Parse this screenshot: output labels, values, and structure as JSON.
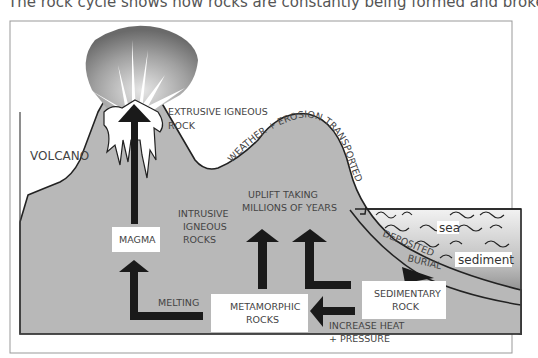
{
  "caption": "The rock cycle shows how rocks are constantly being formed and broken down.",
  "diagram": {
    "labels": {
      "volcano": "VOLCANO",
      "extrusive_line1": "EXTRUSIVE  IGNEOUS",
      "extrusive_line2": "ROCK",
      "weather": "WEATHER + EROSION TRANSPORTED",
      "uplift_line1": "UPLIFT TAKING",
      "uplift_line2": "MILLIONS OF YEARS",
      "intrusive_line1": "INTRUSIVE",
      "intrusive_line2": "IGNEOUS",
      "intrusive_line3": "ROCKS",
      "melting": "MELTING",
      "heat_line1": "INCREASE HEAT",
      "heat_line2": "+ PRESSURE",
      "deposited": "DEPOSITED",
      "burial": "BURIAL",
      "sea": "sea",
      "sediment": "sediment"
    },
    "boxes": {
      "magma": "MAGMA",
      "metamorphic_line1": "METAMORPHIC",
      "metamorphic_line2": "ROCKS",
      "sedimentary_line1": "SEDIMENTARY",
      "sedimentary_line2": "ROCK"
    },
    "colors": {
      "land": "#b8b8b8",
      "arrow": "#1a1a1a",
      "border": "#444444",
      "sea_dark": "#5a5a5a"
    }
  }
}
